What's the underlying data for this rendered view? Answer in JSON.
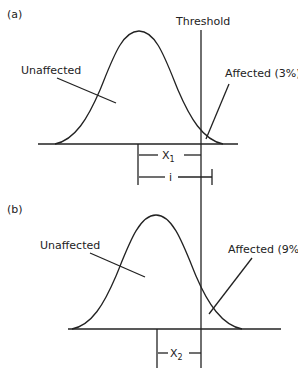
{
  "panel_a": {
    "tag": "(a)",
    "threshold_label": "Threshold",
    "unaffected_label": "Unaffected",
    "affected_label": "Affected (3%)",
    "distance_label": "X",
    "distance_sub": "1",
    "i_label": "i"
  },
  "panel_b": {
    "tag": "(b)",
    "unaffected_label": "Unaffected",
    "affected_label": "Affected (9%)",
    "distance_label": "X",
    "distance_sub": "2"
  },
  "colors": {
    "line": "#222222",
    "background": "#ffffff"
  }
}
